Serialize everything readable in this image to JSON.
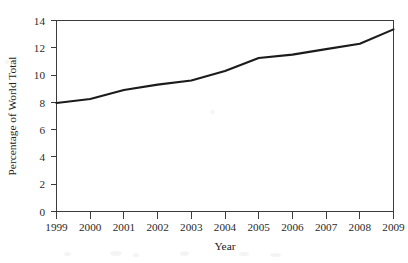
{
  "chart_data": {
    "type": "line",
    "title": "",
    "xlabel": "Year",
    "ylabel": "Percentage of World Total",
    "x": [
      1999,
      2000,
      2001,
      2002,
      2003,
      2004,
      2005,
      2006,
      2007,
      2008,
      2009
    ],
    "categories": [
      "1999",
      "2000",
      "2001",
      "2002",
      "2003",
      "2004",
      "2005",
      "2006",
      "2007",
      "2008",
      "2009"
    ],
    "values": [
      7.95,
      8.25,
      8.9,
      9.3,
      9.6,
      10.3,
      11.25,
      11.5,
      11.9,
      12.3,
      13.35
    ],
    "series": [
      {
        "name": "Percentage of World Total",
        "values": [
          7.95,
          8.25,
          8.9,
          9.3,
          9.6,
          10.3,
          11.25,
          11.5,
          11.9,
          12.3,
          13.35
        ]
      }
    ],
    "xlim": [
      1999,
      2009
    ],
    "ylim": [
      0,
      14
    ],
    "yticks": [
      0,
      2,
      4,
      6,
      8,
      10,
      12,
      14
    ],
    "ytick_labels": [
      "0",
      "2",
      "4",
      "6",
      "8",
      "10",
      "12",
      "14"
    ],
    "xticks": [
      1999,
      2000,
      2001,
      2002,
      2003,
      2004,
      2005,
      2006,
      2007,
      2008,
      2009
    ],
    "xtick_labels": [
      "1999",
      "2000",
      "2001",
      "2002",
      "2003",
      "2004",
      "2005",
      "2006",
      "2007",
      "2008",
      "2009"
    ],
    "grid": false,
    "legend": null,
    "legend_position": "none",
    "line_color": "#1b1b1b",
    "axis_color": "#3b3b3b",
    "background_color": "#ffffff",
    "annotations": []
  }
}
